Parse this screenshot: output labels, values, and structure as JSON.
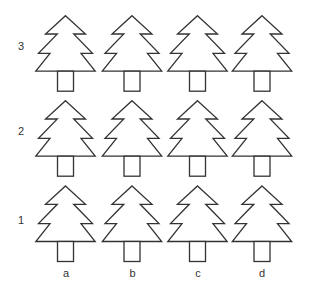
{
  "grid": {
    "rows": [
      {
        "label": "3",
        "y_apex": 15.7
      },
      {
        "label": "2",
        "y_apex": 100.7
      },
      {
        "label": "1",
        "y_apex": 186
      }
    ],
    "columns": [
      {
        "label": "a",
        "x_center": 66
      },
      {
        "label": "b",
        "x_center": 132.5
      },
      {
        "label": "c",
        "x_center": 198
      },
      {
        "label": "d",
        "x_center": 262.5
      }
    ],
    "item": "pine-tree",
    "stroke_color": "#333333",
    "fill_color": "#ffffff"
  }
}
